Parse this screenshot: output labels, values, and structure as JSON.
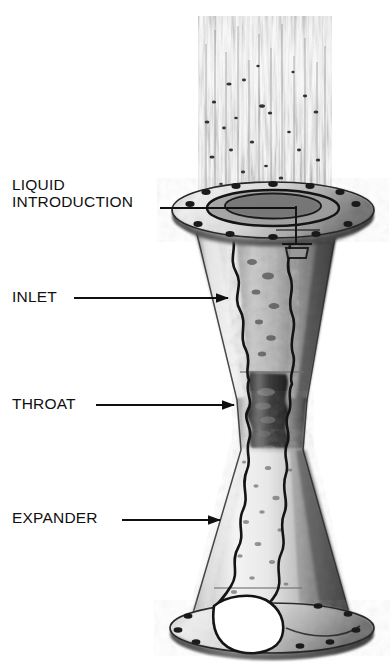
{
  "figure": {
    "background_color": "#ffffff",
    "ink_color": "#101010",
    "style": "grayscale halftone photograph with line callouts"
  },
  "callouts": [
    {
      "id": "liquid-introduction",
      "label": "LIQUID\nINTRODUCTION",
      "leader": {
        "type": "line",
        "x1": 160,
        "y1": 208,
        "x2": 296,
        "y2": 208,
        "arrowhead": false
      }
    },
    {
      "id": "inlet",
      "label": "INLET",
      "leader": {
        "type": "arrow",
        "x1": 74,
        "y1": 298,
        "x2": 228,
        "y2": 298,
        "arrowhead": true
      }
    },
    {
      "id": "throat",
      "label": "THROAT",
      "leader": {
        "type": "arrow",
        "x1": 96,
        "y1": 405,
        "x2": 234,
        "y2": 405,
        "arrowhead": true
      }
    },
    {
      "id": "expander",
      "label": "EXPANDER",
      "leader": {
        "type": "arrow",
        "x1": 122,
        "y1": 520,
        "x2": 220,
        "y2": 520,
        "arrowhead": true
      }
    }
  ],
  "parts": {
    "spray_plume": "spray-plume",
    "top_flange": "top-flange",
    "inlet_cone": "inlet-cone",
    "throat_section": "throat-section",
    "expander_cone": "expander-cone",
    "bottom_flange": "bottom-flange",
    "cutaway_seam": "cutaway-seam",
    "spray_nozzle": "spray-nozzle"
  }
}
